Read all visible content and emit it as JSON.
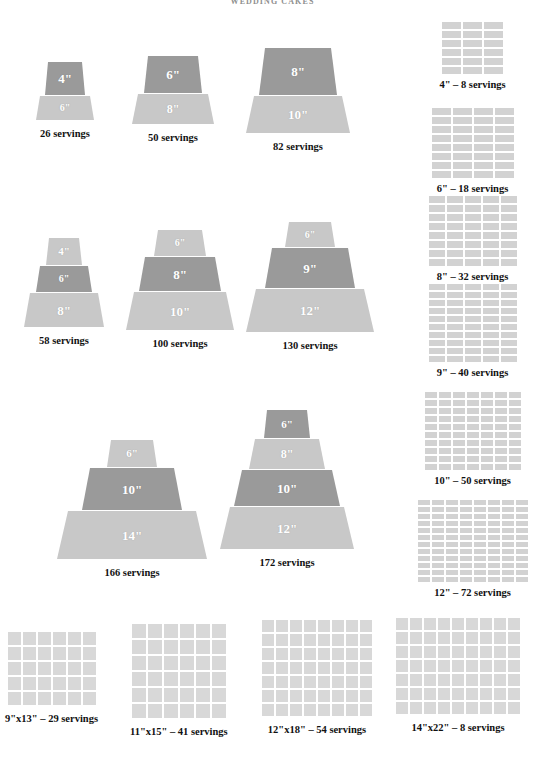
{
  "title": "WEDDING CAKES",
  "colors": {
    "tier_light": "#c8c8c8",
    "tier_dark": "#9a9a9a",
    "grid_cell": "#d2d2d2",
    "sheet_cell": "#d8d8d8",
    "page_background": "#ffffff",
    "caption_text": "#111111",
    "tier_label_text": "#ffffff",
    "title_text": "#8f8f8f"
  },
  "chart_data": {
    "type": "diagram",
    "title": "WEDDING CAKES",
    "tiered_cakes": [
      {
        "id": "cake-4-6",
        "servings": 26,
        "caption": "26 servings",
        "tiers": [
          {
            "size": "4\"",
            "shade": "dark",
            "width": 40,
            "height": 33
          },
          {
            "size": "6\"",
            "shade": "light",
            "width": 58,
            "height": 24
          }
        ]
      },
      {
        "id": "cake-6-8",
        "servings": 50,
        "caption": "50 servings",
        "tiers": [
          {
            "size": "6\"",
            "shade": "dark",
            "width": 58,
            "height": 37
          },
          {
            "size": "8\"",
            "shade": "light",
            "width": 82,
            "height": 30
          }
        ]
      },
      {
        "id": "cake-8-10",
        "servings": 82,
        "caption": "82 servings",
        "tiers": [
          {
            "size": "8\"",
            "shade": "dark",
            "width": 78,
            "height": 47
          },
          {
            "size": "10\"",
            "shade": "light",
            "width": 104,
            "height": 37
          }
        ]
      },
      {
        "id": "cake-4-6-8",
        "servings": 58,
        "caption": "58 servings",
        "tiers": [
          {
            "size": "4\"",
            "shade": "light",
            "width": 36,
            "height": 27
          },
          {
            "size": "6\"",
            "shade": "dark",
            "width": 56,
            "height": 26
          },
          {
            "size": "8\"",
            "shade": "light",
            "width": 80,
            "height": 34
          }
        ]
      },
      {
        "id": "cake-6-8-10",
        "servings": 100,
        "caption": "100 servings",
        "tiers": [
          {
            "size": "6\"",
            "shade": "light",
            "width": 52,
            "height": 26
          },
          {
            "size": "8\"",
            "shade": "dark",
            "width": 82,
            "height": 34
          },
          {
            "size": "10\"",
            "shade": "light",
            "width": 108,
            "height": 38
          }
        ]
      },
      {
        "id": "cake-6-9-12",
        "servings": 130,
        "caption": "130 servings",
        "tiers": [
          {
            "size": "6\"",
            "shade": "light",
            "width": 50,
            "height": 25
          },
          {
            "size": "9\"",
            "shade": "dark",
            "width": 90,
            "height": 40
          },
          {
            "size": "12\"",
            "shade": "light",
            "width": 128,
            "height": 43
          }
        ]
      },
      {
        "id": "cake-6-10-14",
        "servings": 166,
        "caption": "166 servings",
        "tiers": [
          {
            "size": "6\"",
            "shade": "light",
            "width": 50,
            "height": 27
          },
          {
            "size": "10\"",
            "shade": "dark",
            "width": 100,
            "height": 42
          },
          {
            "size": "14\"",
            "shade": "light",
            "width": 150,
            "height": 48
          }
        ]
      },
      {
        "id": "cake-6-8-10-12",
        "servings": 172,
        "caption": "172 servings",
        "tiers": [
          {
            "size": "6\"",
            "shade": "dark",
            "width": 46,
            "height": 28
          },
          {
            "size": "8\"",
            "shade": "light",
            "width": 76,
            "height": 30
          },
          {
            "size": "10\"",
            "shade": "dark",
            "width": 106,
            "height": 36
          },
          {
            "size": "12\"",
            "shade": "light",
            "width": 134,
            "height": 42
          }
        ]
      }
    ],
    "round_cake_servings": [
      {
        "id": "round-4",
        "size": "4\"",
        "servings": 8,
        "caption": "4\" – 8 servings",
        "cols": 3,
        "rows": 6,
        "cell_w": 19,
        "cell_h": 7
      },
      {
        "id": "round-6",
        "size": "6\"",
        "servings": 18,
        "caption": "6\" – 18 servings",
        "cols": 4,
        "rows": 8,
        "cell_w": 19,
        "cell_h": 7
      },
      {
        "id": "round-8",
        "size": "8\"",
        "servings": 32,
        "caption": "8\" – 32 servings",
        "cols": 5,
        "rows": 8,
        "cell_w": 16,
        "cell_h": 7
      },
      {
        "id": "round-9",
        "size": "9\"",
        "servings": 40,
        "caption": "9\" – 40 servings",
        "cols": 5,
        "rows": 10,
        "cell_w": 16,
        "cell_h": 6
      },
      {
        "id": "round-10",
        "size": "10\"",
        "servings": 50,
        "caption": "10\" – 50 servings",
        "cols": 7,
        "rows": 10,
        "cell_w": 12,
        "cell_h": 6
      },
      {
        "id": "round-12",
        "size": "12\"",
        "servings": 72,
        "caption": "12\" – 72 servings",
        "cols": 8,
        "rows": 12,
        "cell_w": 12,
        "cell_h": 5
      }
    ],
    "sheet_cake_servings": [
      {
        "id": "sheet-9x13",
        "size": "9\"x13\"",
        "servings": 29,
        "caption": "9\"x13\" – 29 servings",
        "cols": 6,
        "rows": 5,
        "cell": 13
      },
      {
        "id": "sheet-11x15",
        "size": "11\"x15\"",
        "servings": 41,
        "caption": "11\"x15\" – 41 servings",
        "cols": 6,
        "rows": 6,
        "cell": 14
      },
      {
        "id": "sheet-12x18",
        "size": "12\"x18\"",
        "servings": 54,
        "caption": "12\"x18\" – 54 servings",
        "cols": 8,
        "rows": 7,
        "cell": 12
      },
      {
        "id": "sheet-14x22",
        "size": "14\"x22\"",
        "servings": 8,
        "caption": "14\"x22\" – 8 servings",
        "cols": 9,
        "rows": 7,
        "cell": 12
      }
    ]
  },
  "layout": {
    "cake_positions": [
      {
        "left": 10,
        "top": 62,
        "width": 110
      },
      {
        "left": 118,
        "top": 56,
        "width": 110
      },
      {
        "left": 228,
        "top": 48,
        "width": 140
      },
      {
        "left": 8,
        "top": 238,
        "width": 112
      },
      {
        "left": 120,
        "top": 230,
        "width": 120
      },
      {
        "left": 240,
        "top": 222,
        "width": 140
      },
      {
        "left": 42,
        "top": 440,
        "width": 180
      },
      {
        "left": 212,
        "top": 410,
        "width": 150
      }
    ],
    "round_positions": [
      {
        "top": 22
      },
      {
        "top": 108
      },
      {
        "top": 196
      },
      {
        "top": 284
      },
      {
        "top": 392
      },
      {
        "top": 500
      }
    ],
    "sheet_positions": [
      {
        "left": 5,
        "top": 20
      },
      {
        "left": 130,
        "top": 12
      },
      {
        "left": 262,
        "top": 8
      },
      {
        "left": 396,
        "top": 6
      }
    ]
  }
}
